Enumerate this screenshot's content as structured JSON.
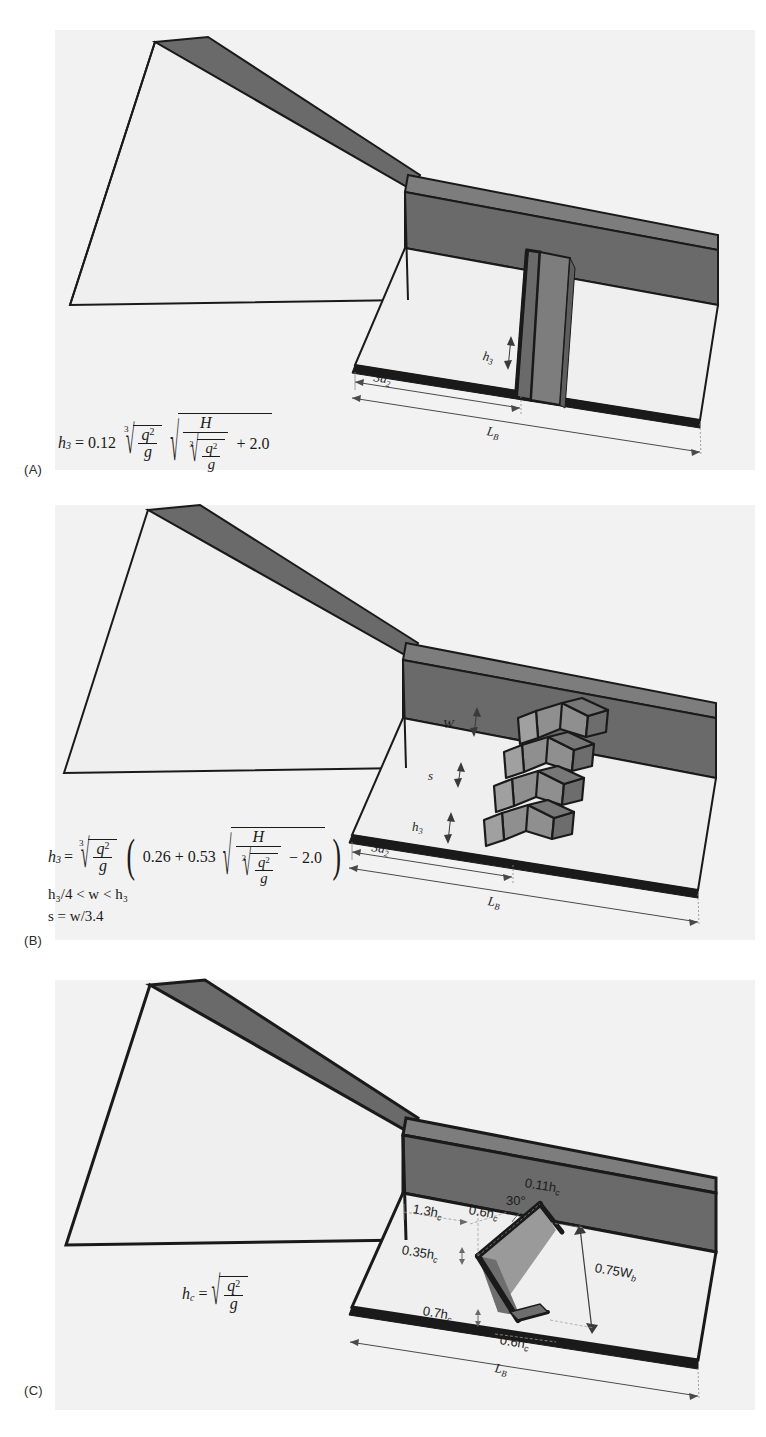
{
  "figure": {
    "background": "#ffffff",
    "panel_bg": "#f2f2f2",
    "colors": {
      "dark_wall": "#6a6a6a",
      "mid_wall": "#7d7d7d",
      "light_floor": "#efefef",
      "chute_floor": "#e9e9e9",
      "block_light": "#9a9a9a",
      "block_mid": "#767676",
      "block_dark": "#5e5e5e",
      "outline": "#1a1a1a",
      "dimension_line": "#3a3a3a",
      "text": "#1a1a1a"
    }
  },
  "panels": [
    {
      "id": "A",
      "label": "(A)",
      "caption_label": "(A)",
      "description": "Stilling basin with a solid end sill",
      "formula": {
        "lhs": "h",
        "lhs_sub": "3",
        "equals": "=",
        "coefficient": "0.12",
        "radical_index": "3",
        "inner_numerator": "q",
        "inner_num_exp": "2",
        "inner_denominator": "g",
        "second_radical_numerator": "H",
        "second_radical_denominator_index": "3",
        "second_radical_den_num": "q",
        "second_radical_den_num_exp": "2",
        "second_radical_den_den": "g",
        "constant_term": "+ 2.0"
      },
      "annotations": [
        {
          "name": "sill-height",
          "text": "h",
          "sub": "3",
          "kind": "arrow-vertical"
        },
        {
          "name": "distance-3d2",
          "text": "3d",
          "sub": "2",
          "kind": "arrow-horizontal"
        },
        {
          "name": "basin-length",
          "text": "L",
          "sub": "B",
          "kind": "arrow-horizontal"
        }
      ]
    },
    {
      "id": "B",
      "label": "(B)",
      "caption_label": "(B)",
      "description": "Stilling basin with staggered chevron baffle blocks",
      "formula": {
        "lhs": "h",
        "lhs_sub": "3",
        "equals": "=",
        "radical_index": "3",
        "inner_numerator": "q",
        "inner_num_exp": "2",
        "inner_denominator": "g",
        "paren_open": "(",
        "term1": "0.26 + 0.53",
        "second_radical_numerator": "H",
        "second_radical_denominator_index": "3",
        "second_radical_den_num": "q",
        "second_radical_den_num_exp": "2",
        "second_radical_den_den": "g",
        "constant_term": "− 2.0",
        "paren_close": ")"
      },
      "conditions": [
        "h₃/4 < w < h₃",
        "s = w/3.4"
      ],
      "condition_parts": [
        {
          "a": "h",
          "a_sub": "3",
          "mid": "/4 < w < h",
          "b_sub": "3"
        },
        {
          "a": "s",
          "mid": " = w/3.4",
          "b_sub": ""
        }
      ],
      "annotations": [
        {
          "name": "block-width",
          "text": "W",
          "sub": "",
          "kind": "arrow-vertical"
        },
        {
          "name": "block-spacing",
          "text": "s",
          "sub": "",
          "kind": "arrow-vertical"
        },
        {
          "name": "block-height",
          "text": "h",
          "sub": "3",
          "kind": "arrow-vertical"
        },
        {
          "name": "distance-3d2",
          "text": "3d",
          "sub": "2",
          "kind": "arrow-horizontal"
        },
        {
          "name": "basin-length",
          "text": "L",
          "sub": "B",
          "kind": "arrow-horizontal"
        }
      ]
    },
    {
      "id": "C",
      "label": "(C)",
      "caption_label": "(C)",
      "description": "Stilling basin with a single V-shaped (chevron) deflector block",
      "formula": {
        "lhs": "h",
        "lhs_sub": "c",
        "equals": "=",
        "radical_numerator": "q",
        "radical_num_exp": "2",
        "radical_denominator": "g"
      },
      "annotations": [
        {
          "name": "wall-thickness",
          "text": "0.11h",
          "sub": "c",
          "kind": "plain"
        },
        {
          "name": "offset-from-chute",
          "text": "1.3h",
          "sub": "c",
          "kind": "arrow-horizontal"
        },
        {
          "name": "apex-offset",
          "text": "0.6h",
          "sub": "c",
          "kind": "arrow-horizontal"
        },
        {
          "name": "deflector-angle",
          "text": "30°",
          "sub": "",
          "kind": "plain"
        },
        {
          "name": "block-thickness-upper",
          "text": "0.35h",
          "sub": "c",
          "kind": "arrow-vertical"
        },
        {
          "name": "deflector-width",
          "text": "0.75W",
          "sub": "b",
          "kind": "arrow-vertical"
        },
        {
          "name": "block-thickness-lower",
          "text": "0.7h",
          "sub": "c",
          "kind": "arrow-vertical"
        },
        {
          "name": "block-base-offset",
          "text": "0.6h",
          "sub": "c",
          "kind": "arrow-horizontal"
        },
        {
          "name": "basin-length",
          "text": "L",
          "sub": "B",
          "kind": "arrow-horizontal"
        }
      ]
    }
  ]
}
